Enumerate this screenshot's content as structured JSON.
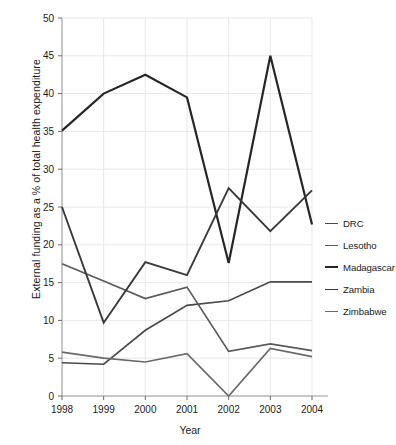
{
  "chart_data": {
    "type": "line",
    "title": "",
    "xlabel": "Year",
    "ylabel": "External funding as a % of total health expenditure",
    "categories": [
      "1998",
      "1999",
      "2000",
      "2001",
      "2002",
      "2003",
      "2004"
    ],
    "x": [
      1998,
      1999,
      2000,
      2001,
      2002,
      2003,
      2004
    ],
    "xlim": [
      1998,
      2004
    ],
    "ylim": [
      0,
      50
    ],
    "yticks": [
      0,
      5,
      10,
      15,
      20,
      25,
      30,
      35,
      40,
      45,
      50
    ],
    "grid": true,
    "legend_position": "right",
    "series": [
      {
        "name": "DRC",
        "color": "#4a4a4a",
        "width": 1.7,
        "values": [
          4.4,
          4.2,
          8.7,
          12.0,
          12.6,
          15.1,
          15.1
        ]
      },
      {
        "name": "Lesotho",
        "color": "#5a5a5a",
        "width": 1.7,
        "values": [
          17.5,
          15.2,
          12.9,
          14.4,
          5.9,
          6.9,
          6.0
        ]
      },
      {
        "name": "Madagascar",
        "color": "#262626",
        "width": 2.2,
        "values": [
          35.1,
          40.0,
          42.5,
          39.5,
          17.6,
          45.0,
          22.7
        ]
      },
      {
        "name": "Zambia",
        "color": "#3a3a3a",
        "width": 1.9,
        "values": [
          25.0,
          9.7,
          17.7,
          16.0,
          27.5,
          21.8,
          27.2
        ]
      },
      {
        "name": "Zimbabwe",
        "color": "#6a6a6a",
        "width": 1.7,
        "values": [
          5.8,
          5.0,
          4.5,
          5.6,
          0.0,
          6.3,
          5.2
        ]
      }
    ]
  },
  "axes": {
    "y_ticks": [
      "50",
      "45",
      "40",
      "35",
      "30",
      "25",
      "20",
      "15",
      "10",
      "5",
      "0"
    ],
    "x_ticks": [
      "1998",
      "1999",
      "2000",
      "2001",
      "2002",
      "2003",
      "2004"
    ],
    "y_title": "External funding as a % of total health expenditure",
    "x_title": "Year"
  },
  "legend": {
    "items": [
      {
        "label": "DRC",
        "color": "#4a4a4a",
        "width": 1.7
      },
      {
        "label": "Lesotho",
        "color": "#5a5a5a",
        "width": 1.7
      },
      {
        "label": "Madagascar",
        "color": "#262626",
        "width": 2.2
      },
      {
        "label": "Zambia",
        "color": "#3a3a3a",
        "width": 1.9
      },
      {
        "label": "Zimbabwe",
        "color": "#6a6a6a",
        "width": 1.7
      }
    ]
  }
}
